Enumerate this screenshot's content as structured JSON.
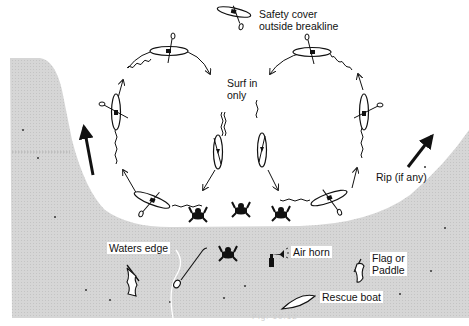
{
  "diagram": {
    "labels": {
      "safety_cover": [
        "Safety cover",
        "outside breakline"
      ],
      "surf_in_only": [
        "Surf in",
        "only"
      ],
      "rip": "Rip (if any)",
      "waters_edge": "Waters edge",
      "air_horn": "Air horn",
      "flag_or_paddle": [
        "Flag or",
        "Paddle"
      ],
      "rescue_boat": "Rescue boat"
    },
    "caption": "Fig. 10.12",
    "colors": {
      "background": "#ffffff",
      "shore_sand": "#d2d2d2",
      "ink": "#111111"
    },
    "elements": {
      "kayaks": 9,
      "swimmers": 4,
      "rip_arrows": 2
    }
  }
}
